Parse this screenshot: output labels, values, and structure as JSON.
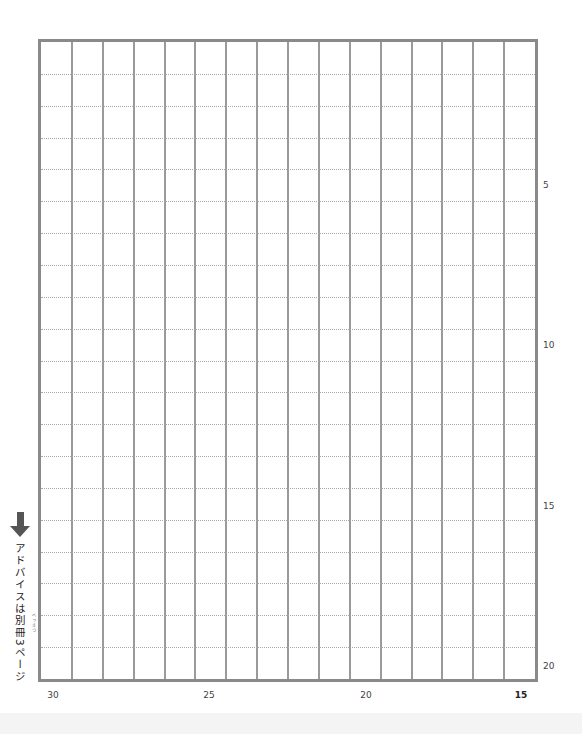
{
  "sheet": {
    "type": "genkou-youshi-grid",
    "columns": 16,
    "rows": 20,
    "border_color": "#8a8a8a",
    "line_color": "#9a9a9a",
    "dotted_color": "#a8a8a8"
  },
  "row_labels": [
    {
      "row": 5,
      "text": "5"
    },
    {
      "row": 10,
      "text": "10"
    },
    {
      "row": 15,
      "text": "15"
    },
    {
      "row": 20,
      "text": "20"
    }
  ],
  "column_labels": [
    {
      "text": "30",
      "bold": false
    },
    {
      "text": "25",
      "bold": false
    },
    {
      "text": "20",
      "bold": false
    },
    {
      "text": "15",
      "bold": true
    }
  ],
  "advice": {
    "arrow_icon": "arrow-down-icon",
    "text": "アドバイスは別冊3ページ",
    "ruby": "べっさつ"
  }
}
